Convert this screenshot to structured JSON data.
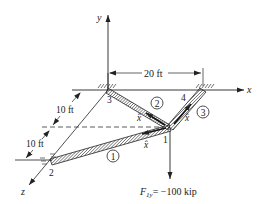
{
  "diagram": {
    "axes": {
      "x_label": "x",
      "y_label": "y",
      "z_label": "z"
    },
    "nodes": [
      {
        "id": "1",
        "label": "1"
      },
      {
        "id": "2",
        "label": "2"
      },
      {
        "id": "3",
        "label": "3"
      },
      {
        "id": "4",
        "label": "4"
      }
    ],
    "elements": [
      {
        "id": "1",
        "label": "1",
        "from": "1",
        "to": "2",
        "local_axis": "x̂"
      },
      {
        "id": "2",
        "label": "2",
        "from": "1",
        "to": "3",
        "local_axis": "x̂"
      },
      {
        "id": "3",
        "label": "3",
        "from": "1",
        "to": "4",
        "local_axis": "x̂"
      }
    ],
    "dimensions": {
      "horizontal": "20 ft",
      "depth_upper": "10 ft",
      "depth_lower": "10 ft"
    },
    "load": {
      "label_main": "F",
      "label_sub": "1y",
      "label_value": "= −100 kip"
    }
  }
}
